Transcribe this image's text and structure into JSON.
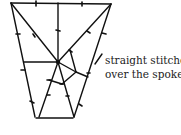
{
  "diagram": {
    "annotation": {
      "line1": "straight stitches",
      "line2": "over the spokes"
    },
    "colors": {
      "ink": "#111111",
      "background": "#ffffff"
    }
  }
}
